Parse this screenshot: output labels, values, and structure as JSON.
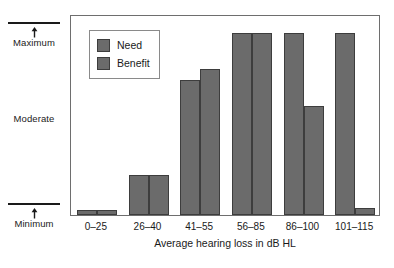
{
  "chart_data": {
    "type": "bar",
    "title": "",
    "xlabel": "Average hearing loss in dB HL",
    "ylabel": "",
    "categories": [
      "0–25",
      "26–40",
      "41–55",
      "56–85",
      "86–100",
      "101–115"
    ],
    "y_tick_labels": [
      "Maximum",
      "Moderate",
      "Minimum"
    ],
    "ylim": [
      0,
      100
    ],
    "y_axis_note": "Ordinal scale: Minimum at bottom tick, Maximum at top tick, Moderate midway (unlabeled tick line)",
    "grid": false,
    "legend_position": "top-left inside plot area",
    "series": [
      {
        "name": "Need",
        "values": [
          3,
          22,
          74,
          100,
          100,
          100
        ]
      },
      {
        "name": "Benefit",
        "values": [
          3,
          22,
          80,
          100,
          60,
          4
        ]
      }
    ],
    "bar_color": "#6b6b6b",
    "bar_border_color": "#3d3d3d",
    "frame_color": "#6e6e6e"
  },
  "legend": {
    "items": [
      {
        "label": "Need"
      },
      {
        "label": "Benefit"
      }
    ]
  },
  "y_axis": {
    "maximum_label": "Maximum",
    "moderate_label": "Moderate",
    "minimum_label": "Minimum"
  }
}
